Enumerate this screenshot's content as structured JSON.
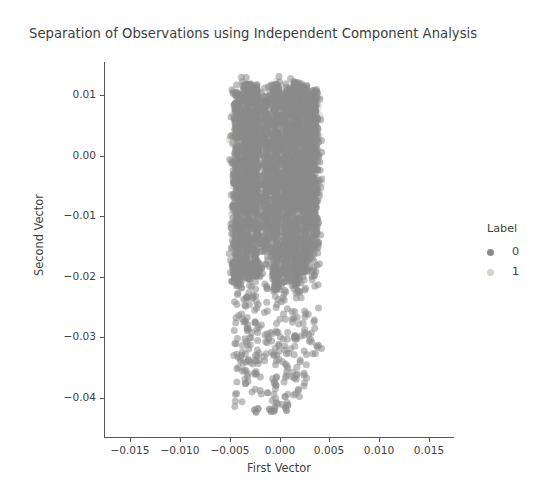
{
  "chart_data": {
    "type": "scatter",
    "title": "Separation of Observations using Independent Component Analysis",
    "xlabel": "First Vector",
    "ylabel": "Second Vector",
    "xlim": [
      -0.0175,
      0.0175
    ],
    "ylim": [
      -0.0465,
      0.0155
    ],
    "xticks": [
      -0.015,
      -0.01,
      -0.005,
      0.0,
      0.005,
      0.01,
      0.015
    ],
    "xticklabels": [
      "-0.015",
      "-0.010",
      "-0.005",
      "0.000",
      "0.005",
      "0.010",
      "0.015"
    ],
    "yticks": [
      0.01,
      0.0,
      -0.01,
      -0.02,
      -0.03,
      -0.04
    ],
    "yticklabels": [
      "0.01",
      "0.00",
      "-0.01",
      "-0.02",
      "-0.03",
      "-0.04"
    ],
    "grid": false,
    "legend": {
      "title": "Label",
      "position": "right",
      "entries": [
        {
          "label": "0",
          "color": "#8a8a8a",
          "count": 4200
        },
        {
          "label": "1",
          "color": "#d6d4c8",
          "count": 1700
        }
      ]
    },
    "marker": {
      "shape": "circle",
      "size": 7,
      "alpha": 0.55
    },
    "series": [
      {
        "name": "0",
        "color": "#8a8a8a",
        "bands": [
          {
            "cx": -0.00425,
            "sx": 0.00028,
            "ymin": -0.0415,
            "ymax": 0.0125,
            "n": 430,
            "ydense_min": -0.0215,
            "ydense_max": 0.0105
          },
          {
            "cx": -0.0033,
            "sx": 0.0003,
            "ymin": -0.04,
            "ymax": 0.013,
            "n": 520,
            "ydense_min": -0.0205,
            "ydense_max": 0.012
          },
          {
            "cx": -0.00235,
            "sx": 0.00026,
            "ymin": -0.0395,
            "ymax": 0.0128,
            "n": 460,
            "ydense_min": -0.02,
            "ydense_max": 0.0118
          },
          {
            "cx": -0.0013,
            "sx": 0.00024,
            "ymin": -0.034,
            "ymax": 0.0115,
            "n": 330,
            "ydense_min": -0.016,
            "ydense_max": 0.01
          },
          {
            "cx": -0.00035,
            "sx": 0.00026,
            "ymin": -0.0425,
            "ymax": 0.0132,
            "n": 540,
            "ydense_min": -0.0225,
            "ydense_max": 0.0122
          },
          {
            "cx": 0.00065,
            "sx": 0.00024,
            "ymin": -0.041,
            "ymax": 0.012,
            "n": 470,
            "ydense_min": -0.021,
            "ydense_max": 0.011
          },
          {
            "cx": 0.0016,
            "sx": 0.00028,
            "ymin": -0.04,
            "ymax": 0.0134,
            "n": 560,
            "ydense_min": -0.0215,
            "ydense_max": 0.0124
          },
          {
            "cx": 0.00255,
            "sx": 0.00026,
            "ymin": -0.0385,
            "ymax": 0.0128,
            "n": 480,
            "ydense_min": -0.0195,
            "ydense_max": 0.0116
          },
          {
            "cx": 0.00345,
            "sx": 0.00028,
            "ymin": -0.033,
            "ymax": 0.0122,
            "n": 380,
            "ydense_min": -0.0155,
            "ydense_max": 0.011
          }
        ],
        "outliers": [
          {
            "x": -0.0025,
            "y": -0.042
          },
          {
            "x": -0.00235,
            "y": -0.0424
          },
          {
            "x": -0.00215,
            "y": -0.0418
          },
          {
            "x": -0.001,
            "y": -0.0419
          },
          {
            "x": -0.00085,
            "y": -0.0423
          },
          {
            "x": 0.0006,
            "y": -0.0416
          },
          {
            "x": 0.0007,
            "y": -0.0421
          },
          {
            "x": 0.00085,
            "y": -0.0412
          },
          {
            "x": -0.0012,
            "y": -0.0392
          },
          {
            "x": 0.00055,
            "y": -0.0398
          }
        ]
      },
      {
        "name": "1",
        "color": "#d6d4c8",
        "bands": [
          {
            "cx": -0.00415,
            "sx": 0.00026,
            "ymin": -0.015,
            "ymax": 0.0095,
            "n": 130,
            "ydense_min": -0.0105,
            "ydense_max": 0.0075
          },
          {
            "cx": -0.00325,
            "sx": 0.00028,
            "ymin": -0.0125,
            "ymax": 0.0118,
            "n": 160,
            "ydense_min": -0.0095,
            "ydense_max": 0.0108
          },
          {
            "cx": -0.0023,
            "sx": 0.00026,
            "ymin": -0.0115,
            "ymax": 0.0112,
            "n": 150,
            "ydense_min": -0.0085,
            "ydense_max": 0.0102
          },
          {
            "cx": -0.0013,
            "sx": 0.00024,
            "ymin": -0.009,
            "ymax": 0.0105,
            "n": 120,
            "ydense_min": -0.0065,
            "ydense_max": 0.0095
          },
          {
            "cx": -0.00035,
            "sx": 0.00026,
            "ymin": -0.012,
            "ymax": 0.0128,
            "n": 180,
            "ydense_min": -0.009,
            "ydense_max": 0.0118
          },
          {
            "cx": 0.00065,
            "sx": 0.00024,
            "ymin": -0.0105,
            "ymax": 0.0112,
            "n": 140,
            "ydense_min": -0.008,
            "ydense_max": 0.0102
          },
          {
            "cx": 0.0016,
            "sx": 0.00028,
            "ymin": -0.013,
            "ymax": 0.013,
            "n": 190,
            "ydense_min": -0.01,
            "ydense_max": 0.012
          },
          {
            "cx": 0.00255,
            "sx": 0.00026,
            "ymin": -0.011,
            "ymax": 0.012,
            "n": 160,
            "ydense_min": -0.0085,
            "ydense_max": 0.011
          },
          {
            "cx": 0.00345,
            "sx": 0.00028,
            "ymin": -0.0095,
            "ymax": 0.0115,
            "n": 130,
            "ydense_min": -0.007,
            "ydense_max": 0.0105
          }
        ],
        "outliers": []
      }
    ]
  }
}
